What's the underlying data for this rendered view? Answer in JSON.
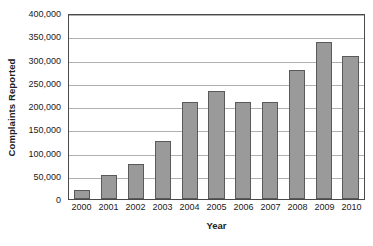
{
  "chart_data": {
    "type": "bar",
    "title": "",
    "xlabel": "Year",
    "ylabel": "Complaints Reported",
    "categories": [
      "2000",
      "2001",
      "2002",
      "2003",
      "2004",
      "2005",
      "2006",
      "2007",
      "2008",
      "2009",
      "2010"
    ],
    "values": [
      20000,
      51000,
      76000,
      125000,
      208000,
      233000,
      208000,
      208000,
      278000,
      338000,
      308000
    ],
    "ylim": [
      0,
      400000
    ],
    "ytick_labels": [
      "0",
      "50,000",
      "100,000",
      "150,000",
      "200,000",
      "250,000",
      "300,000",
      "350,000",
      "400,000"
    ],
    "ytick_values": [
      0,
      50000,
      100000,
      150000,
      200000,
      250000,
      300000,
      350000,
      400000
    ],
    "grid": true,
    "legend": "none",
    "series": [
      {
        "name": "Complaints Reported",
        "values": [
          20000,
          51000,
          76000,
          125000,
          208000,
          233000,
          208000,
          208000,
          278000,
          338000,
          308000
        ]
      }
    ],
    "colors": {
      "bar_fill": "#9a9a9a",
      "bar_edge": "#5a5a5a",
      "gridline": "#b0b0b0",
      "frame": "#4a4a4a",
      "text": "#1a1a1a",
      "background": "#ffffff"
    }
  }
}
